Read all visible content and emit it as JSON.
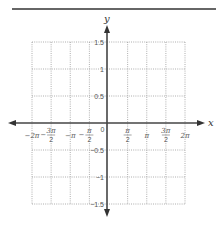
{
  "chart_data": {
    "type": "line",
    "title": "",
    "xlabel": "x",
    "ylabel": "y",
    "xlim": [
      -6.2832,
      6.2832
    ],
    "ylim": [
      -1.5,
      1.5
    ],
    "grid": true,
    "grid_style": "dotted",
    "x_ticks": [
      {
        "value": -6.2832,
        "label": "-2π",
        "num": "-2π",
        "den": ""
      },
      {
        "value": -4.7124,
        "label": "-3π/2",
        "num": "3π",
        "den": "2",
        "neg": true
      },
      {
        "value": -3.1416,
        "label": "-π",
        "num": "-π",
        "den": ""
      },
      {
        "value": -1.5708,
        "label": "-π/2",
        "num": "π",
        "den": "2",
        "neg": true
      },
      {
        "value": 0,
        "label": "0",
        "num": "0",
        "den": ""
      },
      {
        "value": 1.5708,
        "label": "π/2",
        "num": "π",
        "den": "2"
      },
      {
        "value": 3.1416,
        "label": "π",
        "num": "π",
        "den": ""
      },
      {
        "value": 4.7124,
        "label": "3π/2",
        "num": "3π",
        "den": "2"
      },
      {
        "value": 6.2832,
        "label": "2π",
        "num": "2π",
        "den": ""
      }
    ],
    "y_ticks": [
      {
        "value": 1.5,
        "label": "1.5"
      },
      {
        "value": 1,
        "label": "1"
      },
      {
        "value": 0.5,
        "label": "0.5"
      },
      {
        "value": -0.5,
        "label": "-0.5"
      },
      {
        "value": -1,
        "label": "-1"
      },
      {
        "value": -1.5,
        "label": "-1.5"
      }
    ],
    "series": [],
    "note": "Blank coordinate grid with no plotted data"
  },
  "labels": {
    "x_axis": "x",
    "y_axis": "y",
    "origin": "0"
  },
  "colors": {
    "axis": "#444444",
    "grid": "#9a9a9a",
    "rule": "#333333",
    "text": "#555555"
  }
}
